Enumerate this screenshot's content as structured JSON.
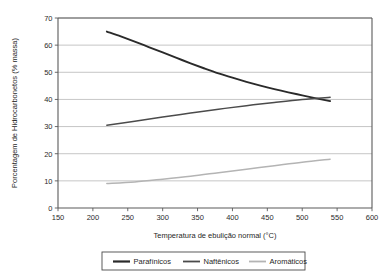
{
  "chart_data": {
    "type": "line",
    "title": "",
    "xlabel": "Temperatura de ebulição normal (°C)",
    "ylabel": "Porcentagem de Hidrocarbonetos (% massa)",
    "xlim": [
      150,
      600
    ],
    "ylim": [
      0,
      70
    ],
    "xticks": [
      150,
      200,
      250,
      300,
      350,
      400,
      450,
      500,
      550,
      600
    ],
    "yticks": [
      0,
      10,
      20,
      30,
      40,
      50,
      60,
      70
    ],
    "xtick_labels": [
      "150",
      "200",
      "250",
      "300",
      "350",
      "400",
      "450",
      "500",
      "550",
      "600"
    ],
    "ytick_labels": [
      "0",
      "10",
      "20",
      "30",
      "40",
      "50",
      "60",
      "70"
    ],
    "grid": "horizontal",
    "legend_position": "bottom",
    "series": [
      {
        "name": "Parafínicos",
        "color": "#2a2a2a",
        "width": 1.9,
        "x": [
          220,
          240,
          260,
          280,
          300,
          320,
          340,
          360,
          380,
          400,
          420,
          440,
          460,
          480,
          500,
          520,
          540
        ],
        "values": [
          65.0,
          63.2,
          61.3,
          59.3,
          57.3,
          55.3,
          53.3,
          51.4,
          49.6,
          48.0,
          46.5,
          45.1,
          43.8,
          42.6,
          41.5,
          40.4,
          39.4
        ]
      },
      {
        "name": "Naftênicos",
        "color": "#4b4b4b",
        "width": 1.5,
        "x": [
          220,
          260,
          300,
          340,
          380,
          420,
          460,
          500,
          540
        ],
        "values": [
          30.5,
          32.0,
          33.5,
          35.0,
          36.4,
          37.7,
          38.9,
          40.0,
          40.8
        ]
      },
      {
        "name": "Aromáticos",
        "color": "#b4b4b4",
        "width": 1.5,
        "x": [
          220,
          260,
          300,
          340,
          380,
          420,
          460,
          500,
          540
        ],
        "values": [
          9.0,
          9.6,
          10.6,
          11.7,
          13.0,
          14.3,
          15.6,
          16.9,
          18.0
        ]
      }
    ],
    "annotations": []
  },
  "legend": {
    "items": [
      {
        "label": "Parafínicos"
      },
      {
        "label": "Naftênicos"
      },
      {
        "label": "Aromáticos"
      }
    ]
  },
  "colors": {
    "axis": "#5a5a5a",
    "grid": "#b8b8b8",
    "background": "#ffffff",
    "text": "#1f1f1f"
  }
}
